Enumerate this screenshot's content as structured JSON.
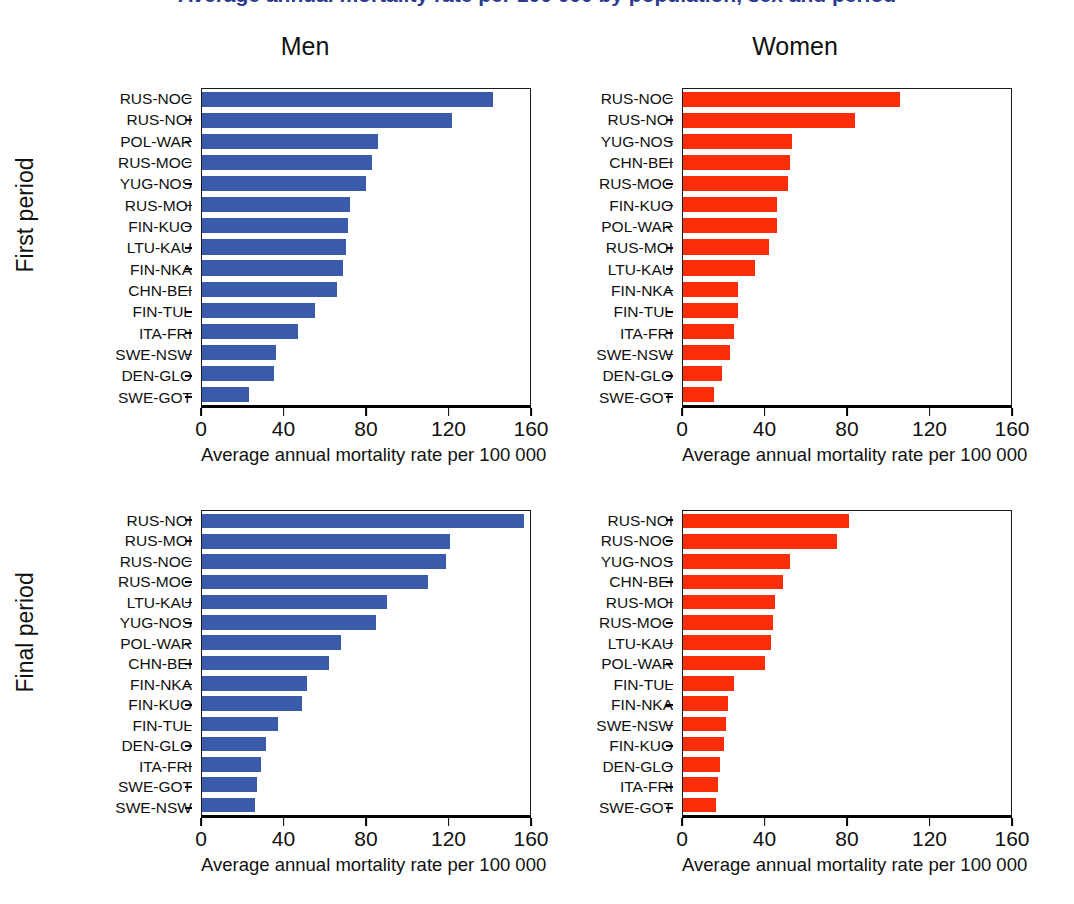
{
  "figure": {
    "cropped_title": "Average annual mortality rate per 100 000 by population, sex and period",
    "row_labels": [
      "First period",
      "Final period"
    ],
    "column_titles": [
      "Men",
      "Women"
    ],
    "x_axis_title": "Average annual mortality rate per 100 000",
    "x_ticks": [
      "0",
      "40",
      "80",
      "120",
      "160"
    ],
    "colors": {
      "men": "#3a5bab",
      "women": "#fa2d09"
    }
  },
  "chart_data": [
    {
      "type": "bar",
      "orientation": "horizontal",
      "title": "Men",
      "panel": "First period",
      "series_name": "Men, first period",
      "color": "#3a5bab",
      "xlabel": "Average annual mortality rate per 100 000",
      "ylabel": "",
      "xlim": [
        0,
        160
      ],
      "xticks": [
        0,
        40,
        80,
        120,
        160
      ],
      "grid": false,
      "legend": "none",
      "categories": [
        "RUS-NOC",
        "RUS-NOI",
        "POL-WAR",
        "RUS-MOC",
        "YUG-NOS",
        "RUS-MOI",
        "FIN-KUO",
        "LTU-KAU",
        "FIN-NKA",
        "CHN-BEI",
        "FIN-TUL",
        "ITA-FRI",
        "SWE-NSW",
        "DEN-GLO",
        "SWE-GOT"
      ],
      "values": [
        142,
        122,
        86,
        83,
        80,
        72,
        71,
        70,
        69,
        66,
        55,
        47,
        36,
        35,
        23
      ]
    },
    {
      "type": "bar",
      "orientation": "horizontal",
      "title": "Women",
      "panel": "First period",
      "series_name": "Women, first period",
      "color": "#fa2d09",
      "xlabel": "Average annual mortality rate per 100 000",
      "ylabel": "",
      "xlim": [
        0,
        160
      ],
      "xticks": [
        0,
        40,
        80,
        120,
        160
      ],
      "grid": false,
      "legend": "none",
      "categories": [
        "RUS-NOC",
        "RUS-NOI",
        "YUG-NOS",
        "CHN-BEI",
        "RUS-MOC",
        "FIN-KUO",
        "POL-WAR",
        "RUS-MOI",
        "LTU-KAU",
        "FIN-NKA",
        "FIN-TUL",
        "ITA-FRI",
        "SWE-NSW",
        "DEN-GLO",
        "SWE-GOT"
      ],
      "values": [
        106,
        84,
        53,
        52,
        51,
        46,
        46,
        42,
        35,
        27,
        27,
        25,
        23,
        19,
        15
      ]
    },
    {
      "type": "bar",
      "orientation": "horizontal",
      "title": "Men",
      "panel": "Final period",
      "series_name": "Men, final period",
      "color": "#3a5bab",
      "xlabel": "Average annual mortality rate per 100 000",
      "ylabel": "",
      "xlim": [
        0,
        160
      ],
      "xticks": [
        0,
        40,
        80,
        120,
        160
      ],
      "grid": false,
      "legend": "none",
      "categories": [
        "RUS-NOI",
        "RUS-MOI",
        "RUS-NOC",
        "RUS-MOC",
        "LTU-KAU",
        "YUG-NOS",
        "POL-WAR",
        "CHN-BEI",
        "FIN-NKA",
        "FIN-KUO",
        "FIN-TUL",
        "DEN-GLO",
        "ITA-FRI",
        "SWE-GOT",
        "SWE-NSW"
      ],
      "values": [
        157,
        121,
        119,
        110,
        90,
        85,
        68,
        62,
        51,
        49,
        37,
        31,
        29,
        27,
        26
      ]
    },
    {
      "type": "bar",
      "orientation": "horizontal",
      "title": "Women",
      "panel": "Final period",
      "series_name": "Women, final period",
      "color": "#fa2d09",
      "xlabel": "Average annual mortality rate per 100 000",
      "ylabel": "",
      "xlim": [
        0,
        160
      ],
      "xticks": [
        0,
        40,
        80,
        120,
        160
      ],
      "grid": false,
      "legend": "none",
      "categories": [
        "RUS-NOI",
        "RUS-NOC",
        "YUG-NOS",
        "CHN-BEI",
        "RUS-MOI",
        "RUS-MOC",
        "LTU-KAU",
        "POL-WAR",
        "FIN-TUL",
        "FIN-NKA",
        "SWE-NSW",
        "FIN-KUO",
        "DEN-GLO",
        "ITA-FRI",
        "SWE-GOT"
      ],
      "values": [
        81,
        75,
        52,
        49,
        45,
        44,
        43,
        40,
        25,
        22,
        21,
        20,
        18,
        17,
        16
      ]
    }
  ]
}
